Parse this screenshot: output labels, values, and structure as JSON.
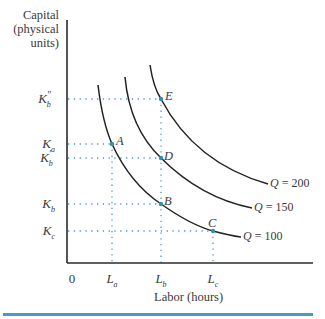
{
  "figure": {
    "y_axis_label_lines": [
      "Capital",
      "(physical",
      "units)"
    ],
    "x_axis_label": "Labor (hours)",
    "origin_label": "0",
    "y_ticks": [
      {
        "base": "K",
        "sub": "b",
        "prime": "″",
        "y": 99
      },
      {
        "base": "K",
        "sub": "a",
        "prime": "",
        "y": 144
      },
      {
        "base": "K",
        "sub": "b",
        "prime": "′",
        "y": 158
      },
      {
        "base": "K",
        "sub": "b",
        "prime": "",
        "y": 204
      },
      {
        "base": "K",
        "sub": "c",
        "prime": "",
        "y": 231
      }
    ],
    "x_ticks": [
      {
        "base": "L",
        "sub": "a",
        "x": 112
      },
      {
        "base": "L",
        "sub": "b",
        "x": 161
      },
      {
        "base": "L",
        "sub": "c",
        "x": 213
      }
    ],
    "points": [
      {
        "label": "A",
        "x": 112,
        "y": 144
      },
      {
        "label": "B",
        "x": 161,
        "y": 204
      },
      {
        "label": "C",
        "x": 213,
        "y": 231
      },
      {
        "label": "D",
        "x": 161,
        "y": 158
      },
      {
        "label": "E",
        "x": 161,
        "y": 99
      }
    ],
    "isoquants": [
      {
        "var": "Q",
        "eq": " = 100",
        "value": 100
      },
      {
        "var": "Q",
        "eq": " = 150",
        "value": 150
      },
      {
        "var": "Q",
        "eq": " = 200",
        "value": 200
      }
    ],
    "colors": {
      "axis": "#2a2a2a",
      "curve": "#222222",
      "dotted_guide": "#4a9bbf",
      "point": "#2f8fb0",
      "bottom_rule": "#4a9bbf"
    }
  }
}
